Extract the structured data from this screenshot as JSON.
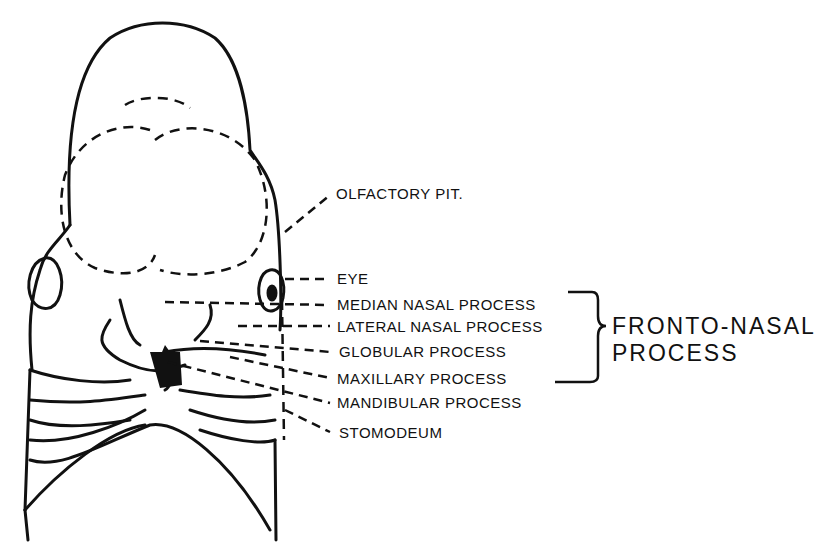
{
  "diagram": {
    "labels": [
      {
        "id": "olfactory-pit",
        "text": "OLFACTORY PIT."
      },
      {
        "id": "eye",
        "text": "EYE"
      },
      {
        "id": "median-nasal-process",
        "text": "MEDIAN NASAL PROCESS"
      },
      {
        "id": "lateral-nasal-process",
        "text": "LATERAL NASAL PROCESS"
      },
      {
        "id": "globular-process",
        "text": "GLOBULAR PROCESS"
      },
      {
        "id": "maxillary-process",
        "text": "MAXILLARY PROCESS"
      },
      {
        "id": "mandibular-process",
        "text": "MANDIBULAR PROCESS"
      },
      {
        "id": "stomodeum",
        "text": "STOMODEUM"
      }
    ],
    "group": {
      "line1": "FRONTO-NASAL",
      "line2": "PROCESS",
      "brackets": [
        "median-nasal-process",
        "lateral-nasal-process",
        "globular-process",
        "maxillary-process"
      ]
    },
    "colors": {
      "ink": "#111111",
      "paper": "#ffffff"
    }
  }
}
